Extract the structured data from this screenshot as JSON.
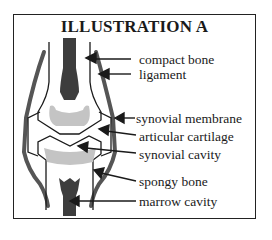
{
  "title": "ILLUSTRATION A",
  "labels": {
    "compact_bone": "compact bone",
    "ligament": "ligament",
    "synovial_membrane": "synovial membrane",
    "articular_cartilage": "articular cartilage",
    "synovial_cavity": "synovial cavity",
    "spongy_bone": "spongy bone",
    "marrow_cavity": "marrow cavity"
  },
  "colors": {
    "outline": "#1a1a1a",
    "ligament": "#555555",
    "compact_bone": "#3d3d3d",
    "spongy_bone": "#c4c4c4",
    "background": "#ffffff"
  }
}
